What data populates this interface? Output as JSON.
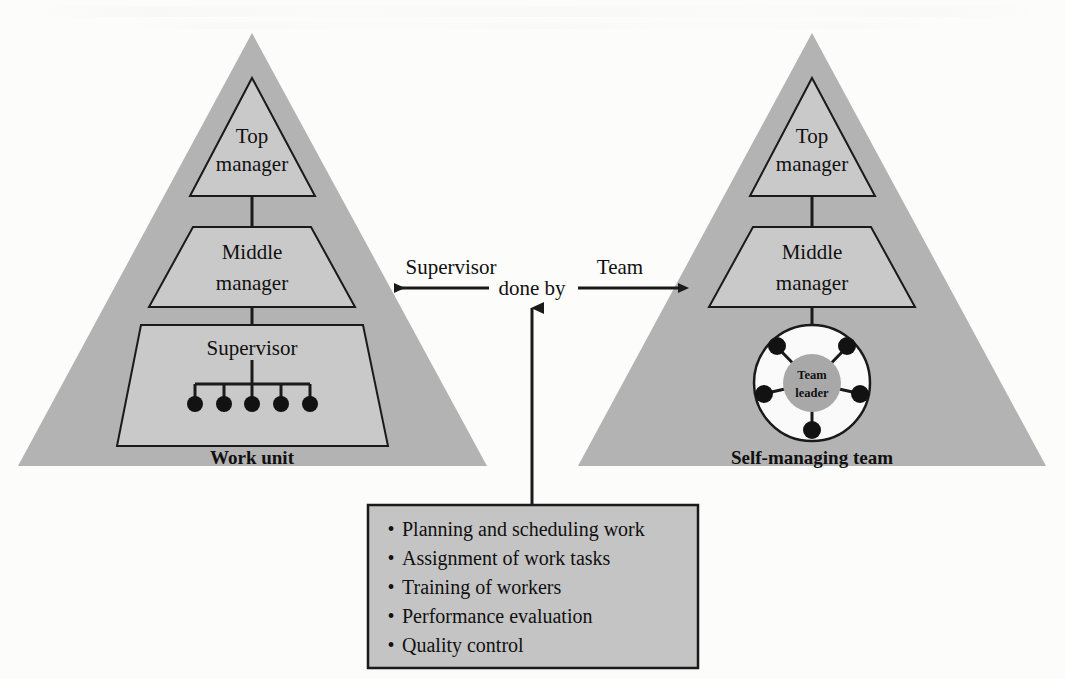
{
  "figure": {
    "type": "comparison-diagram"
  },
  "colors": {
    "pyramid_fill": "#b3b3b3",
    "inner_fill": "#c9c9c9",
    "panel_fill": "#c4c4c4",
    "circle_outer_fill": "#fafafa",
    "circle_inner_fill": "#a8a8a8",
    "line": "#1a1a1a",
    "page_background": "#fcfcfb",
    "text": "#101010"
  },
  "left_pyramid": {
    "caption": "Work unit",
    "levels": [
      {
        "label_line1": "Top",
        "label_line2": "manager",
        "shape": "triangle"
      },
      {
        "label_line1": "Middle",
        "label_line2": "manager",
        "shape": "trapezoid"
      },
      {
        "label_line1": "Supervisor",
        "label_line2": "",
        "shape": "trapezoid"
      }
    ],
    "worker_count": 5
  },
  "right_pyramid": {
    "caption": "Self-managing team",
    "levels": [
      {
        "label_line1": "Top",
        "label_line2": "manager",
        "shape": "triangle"
      },
      {
        "label_line1": "Middle",
        "label_line2": "manager",
        "shape": "trapezoid"
      }
    ],
    "team_circle": {
      "center_label_line1": "Team",
      "center_label_line2": "leader",
      "member_count": 5
    }
  },
  "center_connector": {
    "left_arrow_label": "Supervisor",
    "center_label": "done by",
    "right_arrow_label": "Team"
  },
  "tasks_panel": {
    "items": [
      "Planning and scheduling work",
      "Assignment of work tasks",
      "Training of workers",
      "Performance evaluation",
      "Quality control"
    ],
    "bullet_glyph": "•"
  }
}
